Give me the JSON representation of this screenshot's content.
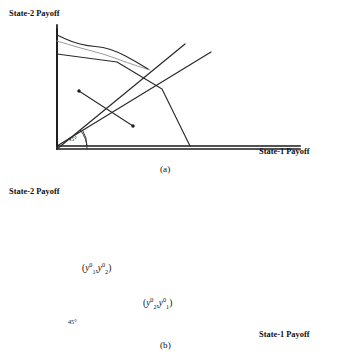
{
  "figure": {
    "kind": "two-panel-line-diagram",
    "background_color": "#ffffff",
    "ink_color": "#1a1a1a",
    "faint_color": "#9a9a9a"
  },
  "panel_a": {
    "caption": "(a)",
    "y_axis_label": "State-2 Payoff",
    "x_axis_label": "State-1 Payoff",
    "angle_label": "45°",
    "geometry": {
      "origin": [
        57,
        146
      ],
      "y_axis_top": [
        57,
        29
      ],
      "x_axis_right": [
        300,
        146
      ],
      "frontier_points": [
        [
          57,
          54
        ],
        [
          117,
          62
        ],
        [
          162,
          89
        ],
        [
          190,
          146
        ]
      ],
      "ray45_start": [
        57,
        146
      ],
      "ray45_end": [
        211,
        52
      ],
      "arc_radius": 30
    }
  },
  "panel_b": {
    "caption": "(b)",
    "y_axis_label": "State-2 Payoff",
    "x_axis_label": "State-1 Payoff",
    "angle_label": "45°",
    "point_labels": [
      {
        "name": "point-label-y1-y2",
        "open": "(",
        "a_base": "y",
        "a_sup": "0",
        "a_sub": "1",
        "comma": ",",
        "b_base": "y",
        "b_sup": "0",
        "b_sub": "2",
        "close": ")"
      },
      {
        "name": "point-label-y2-y1",
        "open": "(",
        "a_base": "y",
        "a_sup": "0",
        "a_sub": "2",
        "comma": ",",
        "b_base": "y",
        "b_sup": "0",
        "b_sub": "1",
        "close": ")"
      }
    ],
    "geometry": {
      "origin": [
        57,
        329
      ],
      "y_axis_top": [
        57,
        205
      ],
      "x_axis_right": [
        300,
        329
      ],
      "frontier_points": [
        [
          57,
          215
        ],
        [
          72,
          222
        ],
        [
          88,
          226
        ],
        [
          103,
          227
        ],
        [
          118,
          232
        ],
        [
          133,
          240
        ],
        [
          148,
          249
        ]
      ],
      "frontier_faint_points": [
        [
          57,
          221
        ],
        [
          80,
          228
        ],
        [
          104,
          234
        ],
        [
          128,
          243
        ],
        [
          150,
          250
        ]
      ],
      "ray45_start": [
        57,
        329
      ],
      "ray45_end": [
        185,
        224
      ],
      "budget_start": [
        79,
        271
      ],
      "budget_end": [
        133,
        306
      ],
      "dot_radius": 1.7,
      "arc_radius": 30
    }
  }
}
